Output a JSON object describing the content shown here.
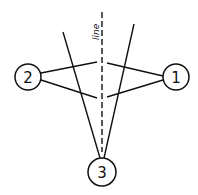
{
  "diagram": {
    "nodes": [
      {
        "id": "1",
        "label": "1"
      },
      {
        "id": "2",
        "label": "2"
      },
      {
        "id": "3",
        "label": "3"
      }
    ],
    "line_label": "line",
    "edges": [
      {
        "from": "2",
        "to": "1",
        "kind": "upper-path-via-line"
      },
      {
        "from": "2",
        "to": "1",
        "kind": "lower-path-via-line"
      },
      {
        "from": "3",
        "kind": "ray-left"
      },
      {
        "from": "3",
        "kind": "ray-right"
      }
    ]
  }
}
